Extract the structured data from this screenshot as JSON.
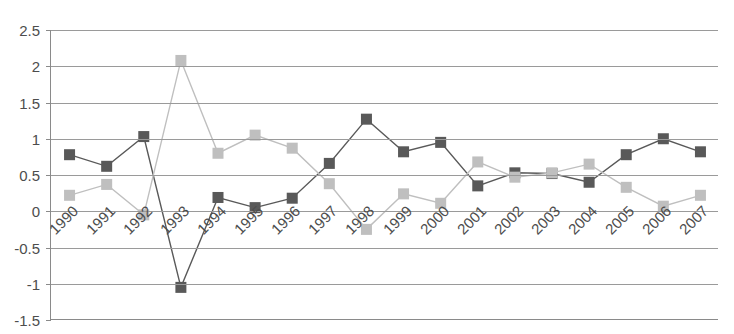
{
  "chart_data": {
    "type": "line",
    "title": "",
    "xlabel": "",
    "ylabel": "",
    "ylim": [
      -1.5,
      2.5
    ],
    "ytick_step": 0.5,
    "yticks": [
      "2.5",
      "2",
      "1.5",
      "1",
      "0.5",
      "0",
      "-0.5",
      "-1",
      "-1.5"
    ],
    "ytick_values": [
      2.5,
      2,
      1.5,
      1,
      0.5,
      0,
      -0.5,
      -1,
      -1.5
    ],
    "grid": true,
    "legend": "none",
    "markers": "square",
    "categories": [
      "1990",
      "1991",
      "1992",
      "1993",
      "1994",
      "1995",
      "1996",
      "1997",
      "1998",
      "1999",
      "2000",
      "2001",
      "2002",
      "2003",
      "2004",
      "2005",
      "2006",
      "2007"
    ],
    "series": [
      {
        "name": "series-dark",
        "color": "#595959",
        "values": [
          0.78,
          0.62,
          1.03,
          -1.05,
          0.19,
          0.05,
          0.18,
          0.66,
          1.27,
          0.82,
          0.95,
          0.35,
          0.53,
          0.52,
          0.4,
          0.78,
          1.0,
          0.82
        ]
      },
      {
        "name": "series-light",
        "color": "#bfbfbf",
        "values": [
          0.22,
          0.37,
          -0.05,
          2.08,
          0.8,
          1.05,
          0.87,
          0.38,
          -0.25,
          0.24,
          0.11,
          0.68,
          0.47,
          0.53,
          0.65,
          0.33,
          0.07,
          0.22
        ]
      }
    ]
  },
  "axis": {
    "frame_color": "#8a8a8a",
    "grid_color": "#9a9a9a"
  }
}
